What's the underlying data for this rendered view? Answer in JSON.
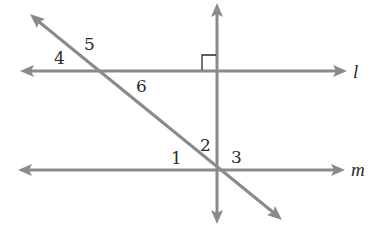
{
  "diagram": {
    "type": "geometry",
    "colors": {
      "line": "#8a8a8a",
      "text": "#2a2a2a",
      "background": "#ffffff"
    },
    "lines": {
      "l": {
        "label": "l",
        "y": 71
      },
      "m": {
        "label": "m",
        "y": 170
      },
      "vertical": {
        "x": 217,
        "perpendicular_to": "l"
      },
      "transversal": {
        "from": [
          32,
          16
        ],
        "to": [
          280,
          218
        ]
      }
    },
    "right_angle_marker": {
      "at": "intersection of vertical line and l"
    },
    "angle_labels": {
      "a1": "1",
      "a2": "2",
      "a3": "3",
      "a4": "4",
      "a5": "5",
      "a6": "6"
    }
  }
}
